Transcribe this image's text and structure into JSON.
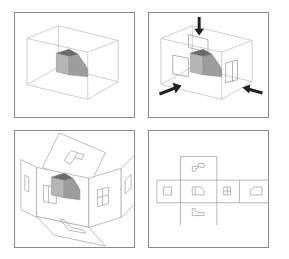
{
  "figure": {
    "panels": [
      {
        "id": "object-in-glass-box",
        "label": "",
        "elements": [
          "wireframe box",
          "shaded solid object"
        ]
      },
      {
        "id": "projection-directions",
        "label": "",
        "elements": [
          "wireframe box",
          "shaded solid object",
          "top arrow",
          "front arrow",
          "side arrow",
          "projection outlines"
        ]
      },
      {
        "id": "unfolding-planes",
        "label": "",
        "elements": [
          "top plane",
          "left plane",
          "front plane",
          "right plane",
          "rear plane",
          "bottom plane",
          "shaded solid object"
        ]
      },
      {
        "id": "multiview-layout",
        "label": "",
        "views": [
          "top view",
          "left view",
          "front view",
          "right view",
          "rear view",
          "bottom view"
        ]
      }
    ]
  },
  "colors": {
    "frame": "#8a8a8a",
    "wire": "#b8b8b8",
    "solid_front": "#b5b5b5",
    "solid_side": "#9c9c9c",
    "solid_top": "#6a6a6a",
    "arrow": "#222222"
  }
}
